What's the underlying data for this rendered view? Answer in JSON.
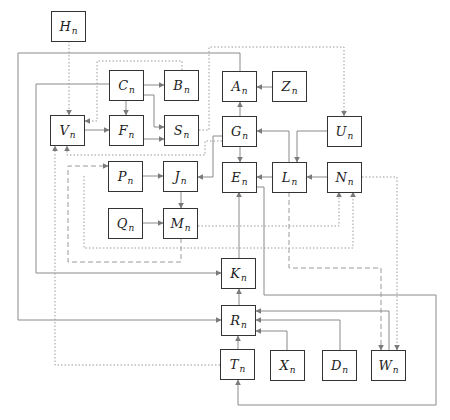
{
  "diagram": {
    "title": "",
    "nodes": [
      {
        "id": "H",
        "label": "H",
        "sub": "n",
        "x": 51,
        "y": 11
      },
      {
        "id": "C",
        "label": "C",
        "sub": "n",
        "x": 109,
        "y": 70
      },
      {
        "id": "B",
        "label": "B",
        "sub": "n",
        "x": 164,
        "y": 70
      },
      {
        "id": "A",
        "label": "A",
        "sub": "n",
        "x": 222,
        "y": 71
      },
      {
        "id": "Z",
        "label": "Z",
        "sub": "n",
        "x": 272,
        "y": 71
      },
      {
        "id": "V",
        "label": "V",
        "sub": "n",
        "x": 50,
        "y": 115
      },
      {
        "id": "F",
        "label": "F",
        "sub": "n",
        "x": 109,
        "y": 115
      },
      {
        "id": "S",
        "label": "S",
        "sub": "n",
        "x": 164,
        "y": 115
      },
      {
        "id": "G",
        "label": "G",
        "sub": "n",
        "x": 222,
        "y": 116
      },
      {
        "id": "U",
        "label": "U",
        "sub": "n",
        "x": 327,
        "y": 116
      },
      {
        "id": "P",
        "label": "P",
        "sub": "n",
        "x": 108,
        "y": 161
      },
      {
        "id": "J",
        "label": "J",
        "sub": "n",
        "x": 163,
        "y": 161
      },
      {
        "id": "E",
        "label": "E",
        "sub": "n",
        "x": 222,
        "y": 162
      },
      {
        "id": "L",
        "label": "L",
        "sub": "n",
        "x": 272,
        "y": 162
      },
      {
        "id": "N",
        "label": "N",
        "sub": "n",
        "x": 327,
        "y": 162
      },
      {
        "id": "Q",
        "label": "Q",
        "sub": "n",
        "x": 108,
        "y": 208
      },
      {
        "id": "M",
        "label": "M",
        "sub": "n",
        "x": 163,
        "y": 208
      },
      {
        "id": "K",
        "label": "K",
        "sub": "n",
        "x": 221,
        "y": 258
      },
      {
        "id": "R",
        "label": "R",
        "sub": "n",
        "x": 221,
        "y": 305
      },
      {
        "id": "T",
        "label": "T",
        "sub": "n",
        "x": 220,
        "y": 349
      },
      {
        "id": "X",
        "label": "X",
        "sub": "n",
        "x": 270,
        "y": 350
      },
      {
        "id": "D",
        "label": "D",
        "sub": "n",
        "x": 322,
        "y": 350
      },
      {
        "id": "W",
        "label": "W",
        "sub": "n",
        "x": 371,
        "y": 350
      }
    ],
    "edges": [
      {
        "from": "H",
        "to": "V",
        "style": "dotted",
        "points": [
          [
            69,
            41
          ],
          [
            69,
            115
          ]
        ]
      },
      {
        "from": "C",
        "to": "B",
        "style": "solid",
        "points": [
          [
            144,
            85
          ],
          [
            164,
            85
          ]
        ]
      },
      {
        "from": "C",
        "to": "F",
        "style": "solid",
        "points": [
          [
            126,
            101
          ],
          [
            126,
            115
          ]
        ]
      },
      {
        "from": "C",
        "to": "S",
        "style": "solid",
        "points": [
          [
            144,
            95
          ],
          [
            154,
            95
          ],
          [
            154,
            127
          ],
          [
            164,
            127
          ]
        ]
      },
      {
        "from": "C",
        "to": "K",
        "style": "solid",
        "points": [
          [
            109,
            84
          ],
          [
            36,
            84
          ],
          [
            36,
            273
          ],
          [
            221,
            273
          ]
        ]
      },
      {
        "from": "B",
        "to": "V",
        "style": "dotted",
        "points": [
          [
            182,
            70
          ],
          [
            182,
            61
          ],
          [
            97,
            61
          ],
          [
            97,
            121
          ],
          [
            85,
            121
          ]
        ]
      },
      {
        "from": "V",
        "to": "F",
        "style": "solid",
        "points": [
          [
            85,
            130
          ],
          [
            109,
            130
          ]
        ]
      },
      {
        "from": "F",
        "to": "S",
        "style": "solid",
        "points": [
          [
            144,
            139
          ],
          [
            164,
            139
          ]
        ]
      },
      {
        "from": "A",
        "to": "R",
        "style": "solid",
        "points": [
          [
            240,
            71
          ],
          [
            240,
            53
          ],
          [
            18,
            53
          ],
          [
            18,
            320
          ],
          [
            221,
            320
          ]
        ]
      },
      {
        "from": "Z",
        "to": "A",
        "style": "solid",
        "points": [
          [
            272,
            87
          ],
          [
            257,
            87
          ]
        ]
      },
      {
        "from": "G",
        "to": "A",
        "style": "solid",
        "points": [
          [
            240,
            116
          ],
          [
            240,
            102
          ]
        ]
      },
      {
        "from": "G",
        "to": "E",
        "style": "solid",
        "points": [
          [
            240,
            146
          ],
          [
            240,
            162
          ]
        ]
      },
      {
        "from": "G",
        "to": "J",
        "style": "solid",
        "points": [
          [
            222,
            136
          ],
          [
            213,
            136
          ],
          [
            213,
            177
          ],
          [
            198,
            177
          ]
        ]
      },
      {
        "from": "S",
        "to": "U",
        "style": "dotted",
        "points": [
          [
            199,
            130
          ],
          [
            209,
            130
          ],
          [
            209,
            47
          ],
          [
            344,
            47
          ],
          [
            344,
            116
          ]
        ]
      },
      {
        "from": "G",
        "to": "V",
        "style": "dotted",
        "points": [
          [
            222,
            141
          ],
          [
            205,
            141
          ],
          [
            205,
            155
          ],
          [
            67,
            155
          ],
          [
            67,
            146
          ]
        ]
      },
      {
        "from": "U",
        "to": "L",
        "style": "solid",
        "points": [
          [
            327,
            131
          ],
          [
            297,
            131
          ],
          [
            297,
            162
          ]
        ]
      },
      {
        "from": "L",
        "to": "G",
        "style": "solid",
        "points": [
          [
            289,
            162
          ],
          [
            289,
            131
          ],
          [
            257,
            131
          ]
        ]
      },
      {
        "from": "L",
        "to": "E",
        "style": "solid",
        "points": [
          [
            272,
            177
          ],
          [
            257,
            177
          ]
        ]
      },
      {
        "from": "N",
        "to": "L",
        "style": "solid",
        "points": [
          [
            327,
            177
          ],
          [
            307,
            177
          ]
        ]
      },
      {
        "from": "E",
        "to": "T",
        "style": "solid",
        "points": [
          [
            257,
            187
          ],
          [
            264,
            187
          ],
          [
            264,
            295
          ],
          [
            436,
            295
          ],
          [
            436,
            405
          ],
          [
            238,
            405
          ],
          [
            238,
            380
          ]
        ]
      },
      {
        "from": "N",
        "to": "W",
        "style": "dotted",
        "points": [
          [
            362,
            177
          ],
          [
            397,
            177
          ],
          [
            397,
            350
          ]
        ]
      },
      {
        "from": "L",
        "to": "W",
        "style": "dashed",
        "points": [
          [
            289,
            192
          ],
          [
            289,
            268
          ],
          [
            381,
            268
          ],
          [
            381,
            350
          ]
        ]
      },
      {
        "from": "P",
        "to": "J",
        "style": "solid",
        "points": [
          [
            143,
            176
          ],
          [
            163,
            176
          ]
        ]
      },
      {
        "from": "J",
        "to": "M",
        "style": "solid",
        "points": [
          [
            181,
            191
          ],
          [
            181,
            208
          ]
        ]
      },
      {
        "from": "Q",
        "to": "M",
        "style": "solid",
        "points": [
          [
            143,
            223
          ],
          [
            163,
            223
          ]
        ]
      },
      {
        "from": "M",
        "to": "N",
        "style": "dotted",
        "points": [
          [
            198,
            226
          ],
          [
            339,
            226
          ],
          [
            339,
            192
          ]
        ]
      },
      {
        "from": "M",
        "to": "P",
        "style": "dashed",
        "points": [
          [
            181,
            238
          ],
          [
            181,
            262
          ],
          [
            68,
            262
          ],
          [
            68,
            166
          ],
          [
            108,
            166
          ]
        ]
      },
      {
        "from": "N-loop",
        "to": "N",
        "style": "dotted",
        "points": [
          [
            84,
            176
          ],
          [
            84,
            248
          ],
          [
            353,
            248
          ],
          [
            353,
            192
          ]
        ]
      },
      {
        "from": "K",
        "to": "E",
        "style": "solid",
        "points": [
          [
            239,
            258
          ],
          [
            239,
            192
          ]
        ]
      },
      {
        "from": "R",
        "to": "K",
        "style": "solid",
        "points": [
          [
            239,
            305
          ],
          [
            239,
            289
          ]
        ]
      },
      {
        "from": "T",
        "to": "R",
        "style": "solid",
        "points": [
          [
            238,
            349
          ],
          [
            238,
            336
          ]
        ]
      },
      {
        "from": "X",
        "to": "R",
        "style": "solid",
        "points": [
          [
            287,
            350
          ],
          [
            287,
            331
          ],
          [
            256,
            331
          ]
        ]
      },
      {
        "from": "D",
        "to": "R",
        "style": "solid",
        "points": [
          [
            340,
            350
          ],
          [
            340,
            320
          ],
          [
            256,
            320
          ]
        ]
      },
      {
        "from": "W",
        "to": "R",
        "style": "solid",
        "points": [
          [
            389,
            350
          ],
          [
            389,
            311
          ],
          [
            256,
            311
          ]
        ]
      },
      {
        "from": "T",
        "to": "V",
        "style": "dotted",
        "points": [
          [
            220,
            365
          ],
          [
            55,
            365
          ],
          [
            55,
            146
          ]
        ]
      }
    ]
  },
  "colors": {
    "node_border": "#333333",
    "edge": "#8a8a8a",
    "background": "#ffffff"
  }
}
